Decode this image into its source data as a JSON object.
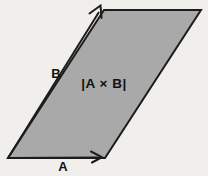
{
  "diagram": {
    "name": "cross-product-parallelogram",
    "labels": {
      "vector_a": "A",
      "vector_b": "B",
      "area": "|A × B|"
    },
    "colors": {
      "parallelogram_fill": "#a9a9a9",
      "line_stroke": "#1c1c1c",
      "background": "#f0efec",
      "text": "#111111"
    }
  }
}
